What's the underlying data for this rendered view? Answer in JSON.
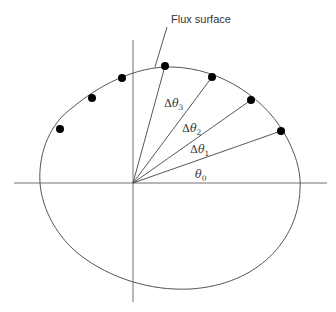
{
  "diagram": {
    "title_label": "Flux surface",
    "angles": [
      {
        "symbol": "θ",
        "prefix": "",
        "sub": "0"
      },
      {
        "symbol": "θ",
        "prefix": "Δ",
        "sub": "1"
      },
      {
        "symbol": "θ",
        "prefix": "Δ",
        "sub": "2"
      },
      {
        "symbol": "θ",
        "prefix": "Δ",
        "sub": "3"
      }
    ],
    "origin": [
      133,
      183
    ],
    "points_on_surface": [
      [
        60,
        129
      ],
      [
        92,
        98
      ],
      [
        122,
        78
      ],
      [
        165,
        66
      ],
      [
        212,
        77
      ],
      [
        251,
        100
      ],
      [
        281,
        131
      ]
    ],
    "colors": {
      "line": "#555555",
      "dot": "#000000",
      "text": "#333333"
    }
  }
}
